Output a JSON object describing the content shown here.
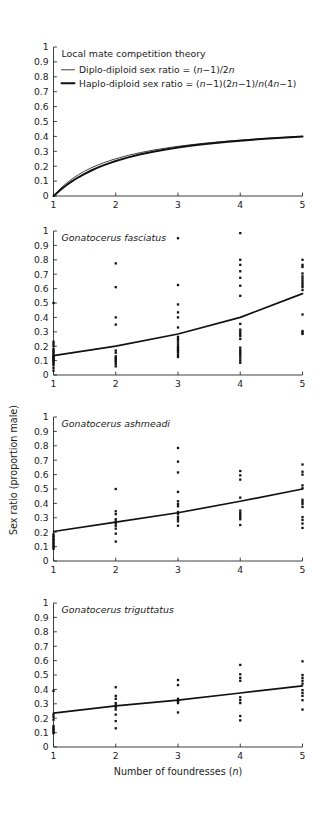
{
  "figure": {
    "width": 324,
    "height": 818,
    "background": "#ffffff",
    "ink_color": "#111111",
    "axis_color": "#2b2b2b",
    "y_axis_title": "Sex ratio (proportion male)",
    "x_axis_title": "Number of foundresses (n)",
    "x_axis_title_parts": {
      "text": "Number of foundresses (",
      "italic": "n",
      "tail": ")"
    }
  },
  "chart_data": [
    {
      "type": "line",
      "panel": 1,
      "title": "Local mate competition theory",
      "title_italic": false,
      "xlabel": "",
      "ylabel": "",
      "xlim": [
        1,
        5
      ],
      "ylim": [
        0,
        1
      ],
      "xticks": [
        1,
        2,
        3,
        4,
        5
      ],
      "yticks": [
        0,
        0.1,
        0.2,
        0.3,
        0.4,
        0.5,
        0.6,
        0.7,
        0.8,
        0.9,
        1
      ],
      "grid": false,
      "legend_position": "top-left",
      "legend": [
        {
          "label": "Diplo-diploid sex ratio = (n−1)/2n",
          "style": "thin",
          "formula_plain": "(n-1)/2n"
        },
        {
          "label": "Haplo-diploid sex ratio = (n−1)(2n−1)/n(4n−1)",
          "style": "thick",
          "formula_plain": "(n-1)(2n-1)/n(4n-1)"
        }
      ],
      "series": [
        {
          "name": "Diplo-diploid sex ratio",
          "style": "thin",
          "x": [
            1,
            1.1,
            1.2,
            1.3,
            1.4,
            1.5,
            1.6,
            1.7,
            1.8,
            1.9,
            2,
            2.2,
            2.4,
            2.6,
            2.8,
            3,
            3.2,
            3.4,
            3.6,
            3.8,
            4,
            4.2,
            4.4,
            4.6,
            4.8,
            5
          ],
          "values": [
            0,
            0.0455,
            0.0833,
            0.1154,
            0.1429,
            0.1667,
            0.1875,
            0.2059,
            0.2222,
            0.2368,
            0.25,
            0.2727,
            0.2917,
            0.3077,
            0.3214,
            0.3333,
            0.3438,
            0.3529,
            0.3611,
            0.3684,
            0.375,
            0.381,
            0.3864,
            0.3913,
            0.3958,
            0.4
          ]
        },
        {
          "name": "Haplo-diploid sex ratio",
          "style": "thick",
          "x": [
            1,
            1.1,
            1.2,
            1.3,
            1.4,
            1.5,
            1.6,
            1.7,
            1.8,
            1.9,
            2,
            2.2,
            2.4,
            2.6,
            2.8,
            3,
            3.2,
            3.4,
            3.6,
            3.8,
            4,
            4.2,
            4.4,
            4.6,
            4.8,
            5
          ],
          "values": [
            0,
            0.0376,
            0.0707,
            0.0998,
            0.1257,
            0.1488,
            0.1696,
            0.1883,
            0.2053,
            0.2207,
            0.2348,
            0.2594,
            0.28,
            0.2976,
            0.3126,
            0.3257,
            0.3372,
            0.3473,
            0.3562,
            0.3642,
            0.3714,
            0.3779,
            0.3838,
            0.3891,
            0.394,
            0.3985
          ]
        }
      ]
    },
    {
      "type": "scatter",
      "panel": 2,
      "title": "Gonatocerus fasciatus",
      "title_italic": true,
      "xlabel": "",
      "ylabel": "Sex ratio (proportion male)",
      "xlim": [
        1,
        5
      ],
      "ylim": [
        0,
        1
      ],
      "xticks": [
        1,
        2,
        3,
        4,
        5
      ],
      "yticks": [
        0,
        0.1,
        0.2,
        0.3,
        0.4,
        0.5,
        0.6,
        0.7,
        0.8,
        0.9,
        1
      ],
      "grid": false,
      "points": [
        {
          "x": 1,
          "y": [
            0.03,
            0.05,
            0.07,
            0.08,
            0.09,
            0.1,
            0.105,
            0.11,
            0.12,
            0.125,
            0.13,
            0.14,
            0.15,
            0.16,
            0.17,
            0.18,
            0.2,
            0.215,
            0.23,
            0.5
          ]
        },
        {
          "x": 2,
          "y": [
            0.06,
            0.075,
            0.09,
            0.1,
            0.11,
            0.12,
            0.13,
            0.155,
            0.17,
            0.35,
            0.4,
            0.61,
            0.775
          ]
        },
        {
          "x": 3,
          "y": [
            0.125,
            0.14,
            0.155,
            0.165,
            0.175,
            0.185,
            0.195,
            0.21,
            0.225,
            0.24,
            0.25,
            0.265,
            0.33,
            0.4,
            0.435,
            0.49,
            0.625,
            0.95
          ]
        },
        {
          "x": 4,
          "y": [
            0.085,
            0.1,
            0.115,
            0.13,
            0.145,
            0.16,
            0.175,
            0.19,
            0.25,
            0.27,
            0.285,
            0.3,
            0.315,
            0.355,
            0.55,
            0.62,
            0.675,
            0.72,
            0.765,
            0.8,
            0.985
          ]
        },
        {
          "x": 5,
          "y": [
            0.285,
            0.295,
            0.305,
            0.42,
            0.59,
            0.61,
            0.625,
            0.64,
            0.655,
            0.67,
            0.685,
            0.705,
            0.75,
            0.765,
            0.8
          ]
        }
      ],
      "fit": {
        "name": "fitted curve",
        "x": [
          1,
          2,
          3,
          4,
          5
        ],
        "values": [
          0.135,
          0.2,
          0.285,
          0.4,
          0.565
        ]
      }
    },
    {
      "type": "scatter",
      "panel": 3,
      "title": "Gonatocerus ashmeadi",
      "title_italic": true,
      "xlabel": "",
      "ylabel": "",
      "xlim": [
        1,
        5
      ],
      "ylim": [
        0,
        1
      ],
      "xticks": [
        1,
        2,
        3,
        4,
        5
      ],
      "yticks": [
        0,
        0.1,
        0.2,
        0.3,
        0.4,
        0.5,
        0.6,
        0.7,
        0.8,
        0.9,
        1
      ],
      "grid": false,
      "points": [
        {
          "x": 1,
          "y": [
            0.085,
            0.095,
            0.105,
            0.115,
            0.125,
            0.135,
            0.145,
            0.155,
            0.165,
            0.175,
            0.185
          ]
        },
        {
          "x": 2,
          "y": [
            0.135,
            0.19,
            0.225,
            0.245,
            0.26,
            0.275,
            0.29,
            0.325,
            0.345,
            0.5
          ]
        },
        {
          "x": 3,
          "y": [
            0.245,
            0.275,
            0.29,
            0.305,
            0.325,
            0.34,
            0.38,
            0.395,
            0.415,
            0.48,
            0.615,
            0.69,
            0.785
          ]
        },
        {
          "x": 4,
          "y": [
            0.25,
            0.29,
            0.305,
            0.32,
            0.335,
            0.35,
            0.44,
            0.565,
            0.595,
            0.625
          ]
        },
        {
          "x": 5,
          "y": [
            0.23,
            0.26,
            0.285,
            0.305,
            0.375,
            0.395,
            0.41,
            0.425,
            0.505,
            0.525,
            0.6,
            0.62,
            0.67
          ]
        }
      ],
      "fit": {
        "name": "fitted line",
        "x": [
          1,
          2,
          3,
          4,
          5
        ],
        "values": [
          0.205,
          0.27,
          0.335,
          0.415,
          0.5
        ]
      }
    },
    {
      "type": "scatter",
      "panel": 4,
      "title": "Gonatocerus triguttatus",
      "title_italic": true,
      "xlabel": "Number of foundresses (n)",
      "ylabel": "",
      "xlim": [
        1,
        5
      ],
      "ylim": [
        0,
        1
      ],
      "xticks": [
        1,
        2,
        3,
        4,
        5
      ],
      "yticks": [
        0,
        0.1,
        0.2,
        0.3,
        0.4,
        0.5,
        0.6,
        0.7,
        0.8,
        0.9,
        1
      ],
      "grid": false,
      "points": [
        {
          "x": 1,
          "y": [
            0.095,
            0.105,
            0.115,
            0.125,
            0.135,
            0.145,
            0.19,
            0.21,
            0.225,
            0.39
          ]
        },
        {
          "x": 2,
          "y": [
            0.13,
            0.18,
            0.225,
            0.26,
            0.275,
            0.29,
            0.305,
            0.335,
            0.355,
            0.415
          ]
        },
        {
          "x": 3,
          "y": [
            0.24,
            0.305,
            0.315,
            0.325,
            0.335,
            0.43,
            0.465
          ]
        },
        {
          "x": 4,
          "y": [
            0.185,
            0.215,
            0.305,
            0.325,
            0.345,
            0.46,
            0.48,
            0.505,
            0.57
          ]
        },
        {
          "x": 5,
          "y": [
            0.26,
            0.325,
            0.355,
            0.375,
            0.395,
            0.44,
            0.46,
            0.48,
            0.5,
            0.595
          ]
        }
      ],
      "fit": {
        "name": "fitted line",
        "x": [
          1,
          2,
          3,
          4,
          5
        ],
        "values": [
          0.235,
          0.285,
          0.325,
          0.375,
          0.425
        ]
      }
    }
  ]
}
